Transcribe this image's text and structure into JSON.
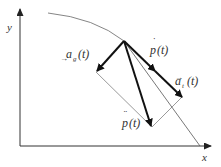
{
  "diagram": {
    "title": "",
    "axes": {
      "x_label": "x",
      "y_label": "y"
    },
    "labels": {
      "a_g": {
        "base": "a",
        "sub": "g",
        "arg": "(t)"
      },
      "p_dot": {
        "base": "p",
        "arg": "(t)"
      },
      "a_t": {
        "base": "a",
        "sub": "t",
        "arg": "(t)"
      },
      "p_ddot": {
        "base": "p",
        "arg": "(t)"
      }
    },
    "colors": {
      "line": "#222222",
      "thin": "#555555",
      "text": "#333333"
    }
  }
}
